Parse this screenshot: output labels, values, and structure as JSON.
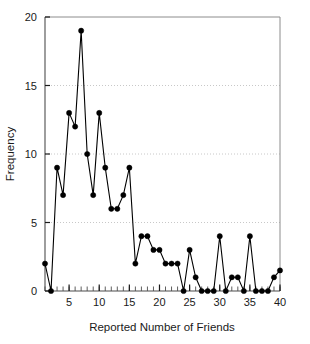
{
  "chart_data": {
    "type": "line",
    "title": "",
    "subtitle": "",
    "xlabel": "Reported Number of Friends",
    "ylabel": "Frequency",
    "xlim": [
      1,
      40
    ],
    "ylim": [
      0,
      20
    ],
    "xticks": [
      5,
      10,
      15,
      20,
      25,
      30,
      35,
      40
    ],
    "xtick_labels": [
      "5",
      "10",
      "15",
      "20",
      "25",
      "30",
      "35",
      "40"
    ],
    "yticks": [
      0,
      5,
      10,
      15,
      20
    ],
    "ytick_labels": [
      "0",
      "5",
      "10",
      "15",
      "20"
    ],
    "x_minor_tick_step": 1,
    "grid": {
      "horizontal": true,
      "vertical": false,
      "style": "dotted",
      "levels": [
        5,
        10,
        15
      ],
      "color": "#c8c8c8"
    },
    "legend": {
      "visible": false,
      "position": "none",
      "entries": []
    },
    "marker": {
      "shape": "circle",
      "size": 4,
      "color": "#000000"
    },
    "line": {
      "color": "#000000",
      "width": 1.1
    },
    "axis_color": "#808080",
    "x": [
      1,
      2,
      3,
      4,
      5,
      6,
      7,
      8,
      9,
      10,
      11,
      12,
      13,
      14,
      15,
      16,
      17,
      18,
      19,
      20,
      21,
      22,
      23,
      24,
      25,
      26,
      27,
      28,
      29,
      30,
      31,
      32,
      33,
      34,
      35,
      36,
      37,
      38,
      39,
      40
    ],
    "values": [
      2,
      0,
      9,
      7,
      13,
      12,
      19,
      10,
      7,
      13,
      9,
      6,
      6,
      7,
      9,
      2,
      4,
      4,
      3,
      3,
      2,
      2,
      2,
      0,
      3,
      1,
      0,
      0,
      0,
      4,
      0,
      1,
      1,
      0,
      4,
      0,
      0,
      0,
      1,
      1.5
    ],
    "series": [
      {
        "name": "Frequency",
        "values": [
          2,
          0,
          9,
          7,
          13,
          12,
          19,
          10,
          7,
          13,
          9,
          6,
          6,
          7,
          9,
          2,
          4,
          4,
          3,
          3,
          2,
          2,
          2,
          0,
          3,
          1,
          0,
          0,
          0,
          4,
          0,
          1,
          1,
          0,
          4,
          0,
          0,
          0,
          1,
          1.5
        ]
      }
    ],
    "annotations": []
  }
}
